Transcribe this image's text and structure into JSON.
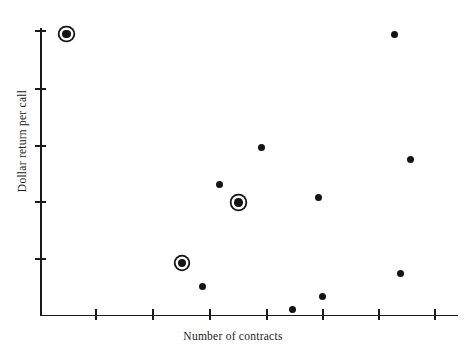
{
  "chart_data": {
    "type": "scatter",
    "title": "",
    "xlabel": "Number of contracts",
    "ylabel": "Dollar return per call",
    "grid": false,
    "legend": null,
    "axis": {
      "x": {
        "tick_labels": [
          "",
          "",
          "",
          "",
          "",
          "",
          ""
        ],
        "tick_positions_px": [
          95,
          152,
          209,
          266,
          322,
          378,
          434
        ],
        "axis_line_px": {
          "x0": 40,
          "x1": 458,
          "y": 315
        }
      },
      "y": {
        "tick_labels": [
          "",
          "",
          "",
          "",
          ""
        ],
        "tick_positions_px": [
          30,
          88,
          145,
          201,
          258
        ],
        "axis_line_px": {
          "y0": 28,
          "y1": 316,
          "x": 40
        }
      }
    },
    "marker_styles": {
      "plain": "filled-circle",
      "ringed": "filled-circle-with-outer-ring"
    },
    "points": [
      {
        "id": "p1",
        "px": 66.5,
        "py": 34.0,
        "style": "ringed"
      },
      {
        "id": "p2",
        "px": 394.0,
        "py": 34.5,
        "style": "plain"
      },
      {
        "id": "p3",
        "px": 261.5,
        "py": 147.5,
        "style": "plain"
      },
      {
        "id": "p4",
        "px": 410.0,
        "py": 159.0,
        "style": "plain"
      },
      {
        "id": "p5",
        "px": 219.0,
        "py": 184.0,
        "style": "plain"
      },
      {
        "id": "p6",
        "px": 318.0,
        "py": 197.0,
        "style": "plain"
      },
      {
        "id": "p7",
        "px": 238.5,
        "py": 202.5,
        "style": "ringed"
      },
      {
        "id": "p8",
        "px": 182.0,
        "py": 263.0,
        "style": "ringed"
      },
      {
        "id": "p9",
        "px": 400.0,
        "py": 273.0,
        "style": "plain"
      },
      {
        "id": "p10",
        "px": 202.5,
        "py": 286.5,
        "style": "plain"
      },
      {
        "id": "p11",
        "px": 322.0,
        "py": 296.5,
        "style": "plain"
      },
      {
        "id": "p12",
        "px": 292.5,
        "py": 309.0,
        "style": "plain"
      }
    ],
    "colors": {
      "marker": "#141414",
      "axis": "#1a1a1a",
      "background": "#ffffff"
    }
  }
}
